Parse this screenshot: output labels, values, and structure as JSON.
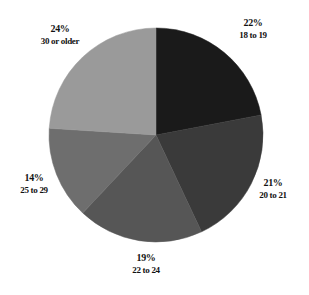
{
  "chart_data": {
    "type": "pie",
    "title": "",
    "subtitle": "",
    "xlabel": "",
    "ylabel": "",
    "legend_position": "none",
    "grid": false,
    "units": "percent",
    "start_angle_deg": 0,
    "direction": "clockwise",
    "categories": [
      "18 to 19",
      "20 to 21",
      "22 to 24",
      "25 to 29",
      "30 or older"
    ],
    "values": [
      22,
      21,
      19,
      14,
      24
    ],
    "labels": [
      "22%",
      "21%",
      "19%",
      "14%",
      "24%"
    ],
    "colors": [
      "#1a1a1a",
      "#3a3a3a",
      "#565656",
      "#6e6e6e",
      "#9a9a9a"
    ],
    "slices": [
      {
        "category": "18 to 19",
        "value": 22,
        "percent_label": "22%",
        "color": "#1a1a1a",
        "start_deg": 0,
        "end_deg": 79.2
      },
      {
        "category": "20 to 21",
        "value": 21,
        "percent_label": "21%",
        "color": "#3a3a3a",
        "start_deg": 79.2,
        "end_deg": 154.8
      },
      {
        "category": "22 to 24",
        "value": 19,
        "percent_label": "19%",
        "color": "#565656",
        "start_deg": 154.8,
        "end_deg": 223.2
      },
      {
        "category": "25 to 29",
        "value": 14,
        "percent_label": "14%",
        "color": "#6e6e6e",
        "start_deg": 223.2,
        "end_deg": 273.6
      },
      {
        "category": "30 or older",
        "value": 24,
        "percent_label": "24%",
        "color": "#9a9a9a",
        "start_deg": 273.6,
        "end_deg": 360
      }
    ]
  },
  "geometry": {
    "center_x": 156,
    "center_y": 135,
    "radius": 107,
    "background": "#ffffff"
  },
  "labels": {
    "slice_0": {
      "percent": "22%",
      "category": "18 to 19"
    },
    "slice_1": {
      "percent": "21%",
      "category": "20 to 21"
    },
    "slice_2": {
      "percent": "19%",
      "category": "22 to 24"
    },
    "slice_3": {
      "percent": "14%",
      "category": "25 to 29"
    },
    "slice_4": {
      "percent": "24%",
      "category": "30 or older"
    }
  }
}
